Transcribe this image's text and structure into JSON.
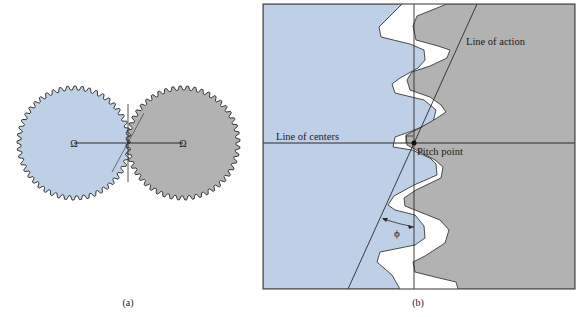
{
  "figure": {
    "panel_a": {
      "caption": "(a)",
      "left_gear": {
        "color": "#bdd0e6",
        "center_symbol": "Ω"
      },
      "right_gear": {
        "color": "#b2b2b2",
        "center_symbol": "Ω"
      }
    },
    "panel_b": {
      "caption": "(b)",
      "label_line_of_centers": "Line of centers",
      "label_line_of_action": "Line of action",
      "label_pitch_point": "Pitch point",
      "label_pressure_angle": "ϕ",
      "left_color": "#bdd0e6",
      "right_color": "#b2b2b2"
    }
  }
}
